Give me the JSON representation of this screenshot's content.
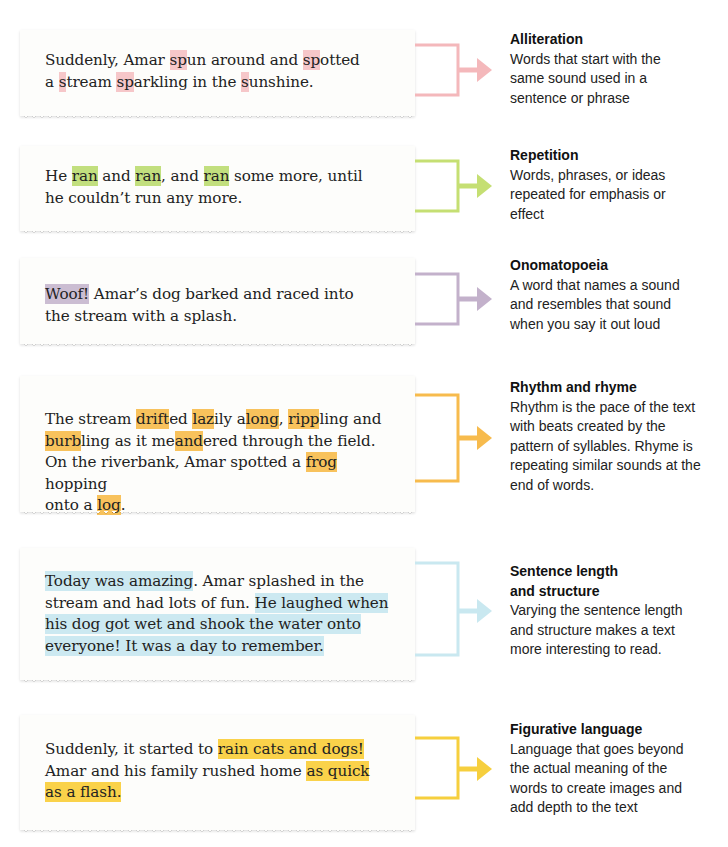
{
  "colors": {
    "alliteration": "#f6c7c9",
    "repetition": "#c2df7e",
    "onomatopoeia": "#cbbdd2",
    "rhythm": "#f8c25c",
    "sentence": "#cce9f1",
    "figurative": "#fad24a",
    "bracket_alliteration": "#f4b8bb",
    "bracket_repetition": "#c5df73",
    "bracket_onomatopoeia": "#c3b1cb",
    "bracket_rhythm": "#f7bb4d",
    "bracket_sentence": "#c9e8f0",
    "bracket_figurative": "#f6cf3e"
  },
  "devices": [
    {
      "title": "Alliteration",
      "description": "Words that start with the same sound used in a sentence or phrase",
      "passage": [
        {
          "t": "Suddenly, Amar "
        },
        {
          "t": "sp",
          "h": 1
        },
        {
          "t": "un around and "
        },
        {
          "t": "sp",
          "h": 1
        },
        {
          "t": "otted"
        },
        {
          "br": 1
        },
        {
          "t": "a "
        },
        {
          "t": "s",
          "h": 1
        },
        {
          "t": "tream "
        },
        {
          "t": "sp",
          "h": 1
        },
        {
          "t": "arkling in the "
        },
        {
          "t": "s",
          "h": 1
        },
        {
          "t": "unshine."
        }
      ]
    },
    {
      "title": "Repetition",
      "description": "Words, phrases, or ideas repeated for emphasis or effect",
      "passage": [
        {
          "t": "He "
        },
        {
          "t": "ran",
          "h": 1
        },
        {
          "t": " and "
        },
        {
          "t": "ran",
          "h": 1
        },
        {
          "t": ", and "
        },
        {
          "t": "ran",
          "h": 1
        },
        {
          "t": " some more, until"
        },
        {
          "br": 1
        },
        {
          "t": "he couldn’t run any more."
        }
      ]
    },
    {
      "title": "Onomatopoeia",
      "description": "A word that names a sound and resembles that sound when you say it out loud",
      "passage": [
        {
          "t": "Woof!",
          "h": 1
        },
        {
          "t": " Amar’s dog barked and raced into"
        },
        {
          "br": 1
        },
        {
          "t": "the stream with a splash."
        }
      ]
    },
    {
      "title": "Rhythm and rhyme",
      "description": "Rhythm is the pace of the text with beats created by the pattern of syllables. Rhyme is repeating similar sounds at the end of words.",
      "passage": [
        {
          "t": "The stream "
        },
        {
          "t": "drift",
          "h": 1
        },
        {
          "t": "ed "
        },
        {
          "t": "laz",
          "h": 1
        },
        {
          "t": "ily a"
        },
        {
          "t": "long",
          "h": 1
        },
        {
          "t": ", "
        },
        {
          "t": "ripp",
          "h": 1
        },
        {
          "t": "ling and"
        },
        {
          "br": 1
        },
        {
          "t": "burb",
          "h": 1
        },
        {
          "t": "ling as it me"
        },
        {
          "t": "and",
          "h": 1
        },
        {
          "t": "ered through the field."
        },
        {
          "br": 1
        },
        {
          "t": "On the riverbank, Amar spotted a "
        },
        {
          "t": "frog",
          "h": 1
        },
        {
          "t": " hopping"
        },
        {
          "br": 1
        },
        {
          "t": "onto a "
        },
        {
          "t": "log",
          "h": 1
        },
        {
          "t": "."
        }
      ]
    },
    {
      "title": "Sentence length and structure",
      "title_lines": [
        "Sentence length",
        "and structure"
      ],
      "description": "Varying the sentence length and structure makes a text more interesting to read.",
      "passage": [
        {
          "t": "Today was amazing",
          "h": 1
        },
        {
          "t": ". Amar splashed in the"
        },
        {
          "br": 1
        },
        {
          "t": "stream and had lots of fun. "
        },
        {
          "t": "He laughed when",
          "h": 1
        },
        {
          "br": 1
        },
        {
          "t": "his dog got wet and shook the water onto",
          "h": 1
        },
        {
          "br": 1
        },
        {
          "t": "everyone! It was a day to remember.",
          "h": 1
        }
      ]
    },
    {
      "title": "Figurative language",
      "description": "Language that goes beyond the actual meaning of the words to create images and add depth to the text",
      "passage": [
        {
          "t": "Suddenly, it started to "
        },
        {
          "t": "rain cats and dogs!",
          "h": 1
        },
        {
          "br": 1
        },
        {
          "t": "Amar and his family rushed home "
        },
        {
          "t": "as quick",
          "h": 1
        },
        {
          "br": 1
        },
        {
          "t": "as a flash.",
          "h": 1
        }
      ]
    }
  ]
}
